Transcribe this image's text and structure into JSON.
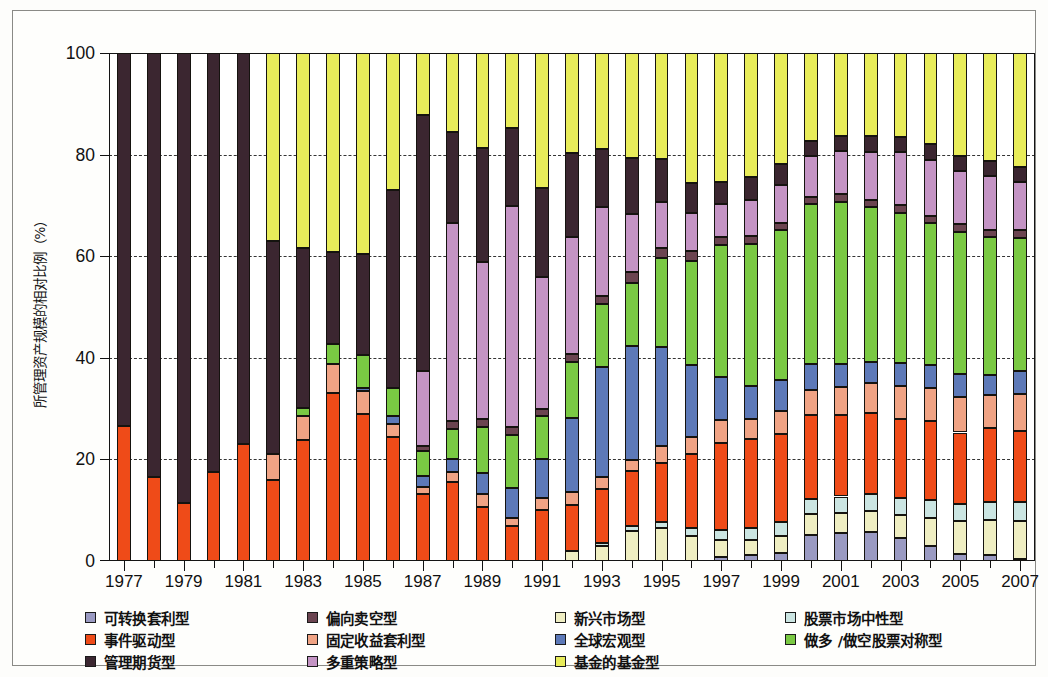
{
  "figure": {
    "y_axis_title": "所管理资产规模的相对比例（%）",
    "y_ticks": [
      "0",
      "20",
      "40",
      "60",
      "80",
      "100"
    ],
    "background": "#fdfdfb",
    "frame_color": "#8a8a86"
  },
  "legend": {
    "items": [
      {
        "label": "可转换套利型",
        "color": "#9a9ac2",
        "key": "convertible_arbitrage"
      },
      {
        "label": "事件驱动型",
        "color": "#ef4b18",
        "key": "event_driven"
      },
      {
        "label": "管理期货型",
        "color": "#3b2630",
        "key": "managed_futures"
      },
      {
        "label": "偏向卖空型",
        "color": "#6b4450",
        "key": "dedicated_short"
      },
      {
        "label": "固定收益套利型",
        "color": "#f0a384",
        "key": "fixed_income_arbitrage"
      },
      {
        "label": "多重策略型",
        "color": "#c494c4",
        "key": "multi_strategy"
      },
      {
        "label": "新兴市场型",
        "color": "#efeec2",
        "key": "emerging_markets"
      },
      {
        "label": "全球宏观型",
        "color": "#5d79b8",
        "key": "global_macro"
      },
      {
        "label": "基金的基金型",
        "color": "#e8ec5a",
        "key": "fund_of_funds"
      },
      {
        "label": "股票市场中性型",
        "color": "#cbe5e2",
        "key": "equity_market_neutral"
      },
      {
        "label": "做多 /做空股票对称型",
        "color": "#7ac943",
        "key": "long_short_equity"
      }
    ]
  },
  "chart_data": {
    "type": "bar",
    "stacked": true,
    "normalized_percent": true,
    "title": "",
    "xlabel": "",
    "ylabel": "所管理资产规模的相对比例（%）",
    "ylim": [
      0,
      100
    ],
    "grid": "horizontal-dashed",
    "legend_position": "bottom",
    "categories": [
      "1977",
      "1978",
      "1979",
      "1980",
      "1981",
      "1982",
      "1983",
      "1984",
      "1985",
      "1986",
      "1987",
      "1988",
      "1989",
      "1990",
      "1991",
      "1992",
      "1993",
      "1994",
      "1995",
      "1996",
      "1997",
      "1998",
      "1999",
      "2000",
      "2001",
      "2002",
      "2003",
      "2004",
      "2005",
      "2006",
      "2007"
    ],
    "tick_labels": [
      "1977",
      "1979",
      "1981",
      "1983",
      "1985",
      "1987",
      "1989",
      "1991",
      "1993",
      "1995",
      "1997",
      "1999",
      "2001",
      "2003",
      "2005",
      "2007"
    ],
    "stack_order_bottom_to_top": [
      "convertible_arbitrage",
      "emerging_markets",
      "equity_market_neutral",
      "event_driven",
      "fixed_income_arbitrage",
      "global_macro",
      "long_short_equity",
      "dedicated_short",
      "multi_strategy",
      "managed_futures",
      "fund_of_funds"
    ],
    "series": [
      {
        "name": "可转换套利型",
        "key": "convertible_arbitrage",
        "color": "#9a9ac2",
        "values": [
          0,
          0,
          0,
          0,
          0,
          0,
          0,
          0,
          0,
          0,
          0,
          0,
          0,
          0,
          0,
          0,
          0,
          0,
          0,
          0,
          0.7,
          1.2,
          1.5,
          5.2,
          5.5,
          5.8,
          4.5,
          3.0,
          1.3,
          1.1,
          0.5
        ]
      },
      {
        "name": "新兴市场型",
        "key": "emerging_markets",
        "color": "#efeec2",
        "values": [
          0,
          0,
          0,
          0,
          0,
          0,
          0,
          0,
          0,
          0,
          0,
          0,
          0,
          0,
          0,
          2.0,
          3.0,
          6.0,
          6.5,
          5.0,
          3.5,
          3.0,
          3.5,
          4.0,
          4.0,
          4.0,
          4.5,
          5.5,
          6.5,
          7.0,
          7.5
        ]
      },
      {
        "name": "股票市场中性型",
        "key": "equity_market_neutral",
        "color": "#cbe5e2",
        "values": [
          0,
          0,
          0,
          0,
          0,
          0,
          0,
          0,
          0,
          0,
          0,
          0,
          0,
          0,
          0,
          0,
          0.6,
          0.8,
          1.2,
          1.5,
          2.0,
          2.3,
          2.6,
          3.0,
          3.2,
          3.3,
          3.5,
          3.5,
          3.5,
          3.6,
          3.8
        ]
      },
      {
        "name": "事件驱动型",
        "key": "event_driven",
        "color": "#ef4b18",
        "values": [
          26.5,
          16.5,
          11.5,
          17.5,
          23.0,
          16.0,
          23.0,
          33.0,
          29.0,
          24.5,
          13.0,
          15.5,
          10.5,
          6.5,
          10.0,
          9.0,
          10.5,
          11.0,
          11.5,
          14.5,
          17.0,
          17.5,
          17.5,
          16.5,
          16.0,
          16.0,
          15.5,
          15.5,
          14.0,
          14.5,
          14.0
        ]
      },
      {
        "name": "固定收益套利型",
        "key": "fixed_income_arbitrage",
        "color": "#f0a384",
        "values": [
          0,
          0,
          0,
          0,
          0,
          5.0,
          4.5,
          5.5,
          4.5,
          2.5,
          1.5,
          2.0,
          2.5,
          1.5,
          2.5,
          2.5,
          2.5,
          2.0,
          3.5,
          3.5,
          4.5,
          4.0,
          4.5,
          5.0,
          5.5,
          6.0,
          6.5,
          6.5,
          7.0,
          6.5,
          7.5
        ]
      },
      {
        "name": "全球宏观型",
        "key": "global_macro",
        "color": "#5d79b8",
        "values": [
          0,
          0,
          0,
          0,
          0,
          0,
          0,
          0,
          0.5,
          1.5,
          2.0,
          2.5,
          4.0,
          5.5,
          7.5,
          14.5,
          21.5,
          22.5,
          19.5,
          14.0,
          8.5,
          6.5,
          6.0,
          5.0,
          4.5,
          4.0,
          4.5,
          4.5,
          4.5,
          4.0,
          4.5
        ]
      },
      {
        "name": "做多 /做空股票对称型",
        "key": "long_short_equity",
        "color": "#7ac943",
        "values": [
          0,
          0,
          0,
          0,
          0,
          0,
          1.5,
          4.0,
          6.5,
          5.5,
          5.0,
          6.0,
          9.0,
          10.0,
          8.5,
          11.0,
          12.5,
          12.5,
          17.5,
          20.5,
          26.0,
          28.0,
          29.5,
          31.5,
          32.0,
          30.5,
          29.5,
          28.0,
          28.0,
          27.0,
          26.5
        ]
      },
      {
        "name": "偏向卖空型",
        "key": "dedicated_short",
        "color": "#6b4450",
        "values": [
          0,
          0,
          0,
          0,
          0,
          0,
          0,
          0,
          0,
          0,
          1.0,
          1.5,
          1.5,
          1.5,
          1.5,
          1.5,
          1.5,
          2.0,
          2.0,
          2.0,
          1.5,
          1.5,
          1.5,
          1.5,
          1.5,
          1.5,
          1.5,
          1.5,
          1.5,
          1.5,
          1.5
        ]
      },
      {
        "name": "多重策略型",
        "key": "multi_strategy",
        "color": "#c494c4",
        "values": [
          0,
          0,
          0,
          0,
          0,
          0,
          0,
          0,
          0,
          0,
          14.5,
          39.0,
          30.5,
          41.0,
          26.0,
          23.0,
          17.5,
          11.5,
          9.0,
          7.5,
          6.5,
          7.0,
          7.5,
          8.0,
          8.5,
          9.5,
          10.5,
          11.0,
          10.5,
          10.5,
          9.5
        ]
      },
      {
        "name": "管理期货型",
        "key": "managed_futures",
        "color": "#3b2630",
        "values": [
          73.5,
          83.5,
          88.5,
          82.5,
          77.0,
          42.0,
          30.5,
          18.0,
          20.0,
          39.0,
          50.0,
          18.0,
          22.0,
          14.5,
          17.5,
          16.5,
          11.5,
          11.0,
          8.5,
          6.0,
          4.5,
          4.5,
          4.0,
          3.0,
          3.0,
          3.0,
          3.0,
          3.0,
          3.0,
          3.0,
          3.0
        ]
      },
      {
        "name": "基金的基金型",
        "key": "fund_of_funds",
        "color": "#e8ec5a",
        "values": [
          0,
          0,
          0,
          0,
          0,
          37.0,
          37.0,
          39.0,
          39.5,
          27.0,
          12.0,
          15.5,
          18.5,
          14.0,
          26.5,
          19.5,
          18.9,
          20.7,
          20.8,
          25.5,
          25.3,
          24.5,
          21.9,
          17.3,
          16.3,
          16.4,
          16.5,
          18.0,
          20.2,
          21.3,
          22.7
        ]
      }
    ]
  }
}
